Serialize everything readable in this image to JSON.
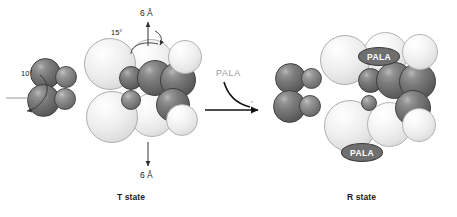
{
  "figure": {
    "background_color": "#ffffff",
    "width": 457,
    "height": 217
  },
  "t_state": {
    "caption": "T state",
    "annotations": {
      "top_distance": "6 Å",
      "bottom_distance": "6 Å",
      "top_rotation": "15°",
      "left_rotation": "10°"
    }
  },
  "r_state": {
    "caption": "R state",
    "ligand_badges": [
      {
        "label": "PALA"
      },
      {
        "label": "PALA"
      }
    ]
  },
  "transition": {
    "label": "PALA"
  },
  "colors": {
    "dark_subunit": "#6a6a6a",
    "light_subunit": "#f0f0f0",
    "badge_fill": "#6f6f6f",
    "badge_text": "#ffffff",
    "annotation_text": "#1a1a1a",
    "reaction_label_text": "#9a9a9a",
    "arrow": "#111111"
  }
}
